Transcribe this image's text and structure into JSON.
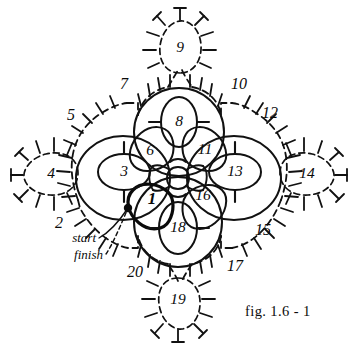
{
  "figure": {
    "caption": "fig.  1.6 - 1",
    "background_color": "#ffffff",
    "ink_color": "#111111",
    "type": "tatting-pattern-diagram"
  },
  "annotations": [
    {
      "id": "start",
      "label": "start",
      "x": 76,
      "y": 240,
      "anchor_x": 128,
      "anchor_y": 208,
      "style": "solid-leader"
    },
    {
      "id": "finish",
      "label": "finish",
      "x": 82,
      "y": 258,
      "anchor_x": 128,
      "anchor_y": 208,
      "style": "dashed-leader"
    }
  ],
  "start_point": {
    "x": 128,
    "y": 208,
    "radius": 4.2
  },
  "rings": [
    {
      "id": "r1",
      "label": "1",
      "cx": 156,
      "cy": 196,
      "rx": 19,
      "ry": 26,
      "rotate": -32,
      "style": "bold",
      "picots": 0
    },
    {
      "id": "r3",
      "label": "3",
      "cx": 124,
      "cy": 172,
      "rx": 26,
      "ry": 18,
      "rotate": 0,
      "style": "solid",
      "picots": 2
    },
    {
      "id": "r4",
      "label": "4",
      "cx": 52,
      "cy": 173,
      "rx": 27,
      "ry": 18,
      "rotate": 0,
      "style": "dashed",
      "picots": 10
    },
    {
      "id": "r6",
      "label": "6",
      "cx": 152,
      "cy": 151,
      "rx": 18,
      "ry": 25,
      "rotate": 40,
      "style": "solid",
      "picots": 0
    },
    {
      "id": "r8",
      "label": "8",
      "cx": 179,
      "cy": 122,
      "rx": 18,
      "ry": 25,
      "rotate": 0,
      "style": "solid",
      "picots": 2
    },
    {
      "id": "r9",
      "label": "9",
      "cx": 180,
      "cy": 47,
      "rx": 19,
      "ry": 26,
      "rotate": 0,
      "style": "dashed",
      "picots": 11
    },
    {
      "id": "r11",
      "label": "11",
      "cx": 203,
      "cy": 150,
      "rx": 18,
      "ry": 25,
      "rotate": -40,
      "style": "solid",
      "picots": 0
    },
    {
      "id": "r13",
      "label": "13",
      "cx": 235,
      "cy": 172,
      "rx": 26,
      "ry": 18,
      "rotate": 0,
      "style": "solid",
      "picots": 2
    },
    {
      "id": "r14",
      "label": "14",
      "cx": 305,
      "cy": 173,
      "rx": 25,
      "ry": 18,
      "rotate": 0,
      "style": "dashed",
      "picots": 10
    },
    {
      "id": "r16",
      "label": "16",
      "cx": 199,
      "cy": 194,
      "rx": 18,
      "ry": 25,
      "rotate": 32,
      "style": "solid",
      "picots": 0
    },
    {
      "id": "r18",
      "label": "18",
      "cx": 178,
      "cy": 228,
      "rx": 19,
      "ry": 26,
      "rotate": 0,
      "style": "solid",
      "picots": 2
    },
    {
      "id": "r19",
      "label": "19",
      "cx": 178,
      "cy": 298,
      "rx": 19,
      "ry": 25,
      "rotate": 0,
      "style": "dashed",
      "picots": 11
    }
  ],
  "outer_rings": [
    {
      "id": "or-top",
      "cx": 179,
      "cy": 132,
      "rx": 45,
      "ry": 44,
      "rotate": 0,
      "style": "solid"
    },
    {
      "id": "or-left",
      "cx": 123,
      "cy": 178,
      "rx": 47,
      "ry": 42,
      "rotate": 0,
      "style": "solid"
    },
    {
      "id": "or-right",
      "cx": 234,
      "cy": 178,
      "rx": 47,
      "ry": 42,
      "rotate": 0,
      "style": "solid"
    },
    {
      "id": "or-bottom",
      "cx": 178,
      "cy": 222,
      "rx": 44,
      "ry": 45,
      "rotate": 0,
      "style": "solid"
    }
  ],
  "chains": [
    {
      "id": "c2",
      "label": "2",
      "label_x": 59,
      "label_y": 224,
      "picots": 6
    },
    {
      "id": "c5",
      "label": "5",
      "label_x": 71,
      "label_y": 116,
      "picots": 6
    },
    {
      "id": "c7",
      "label": "7",
      "label_x": 124,
      "label_y": 85,
      "picots": 6
    },
    {
      "id": "c10",
      "label": "10",
      "label_x": 238,
      "label_y": 85,
      "picots": 6
    },
    {
      "id": "c12",
      "label": "12",
      "label_x": 268,
      "label_y": 114,
      "picots": 6
    },
    {
      "id": "c15",
      "label": "15",
      "label_x": 262,
      "label_y": 231,
      "picots": 6
    },
    {
      "id": "c17",
      "label": "17",
      "label_x": 234,
      "label_y": 267,
      "picots": 6
    },
    {
      "id": "c20",
      "label": "20",
      "label_x": 134,
      "label_y": 273,
      "picots": 6
    }
  ],
  "sequence_numbers": [
    "1",
    "2",
    "3",
    "4",
    "5",
    "6",
    "7",
    "8",
    "9",
    "10",
    "11",
    "12",
    "13",
    "14",
    "15",
    "16",
    "17",
    "18",
    "19",
    "20"
  ]
}
